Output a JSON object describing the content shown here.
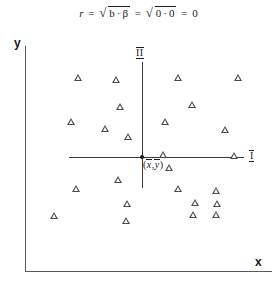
{
  "figure": {
    "formula": {
      "lhs_var": "r",
      "eq1": "=",
      "radicand1_a": "b",
      "radicand1_dot": "·",
      "radicand1_b": "β",
      "eq2": "=",
      "radicand2_a": "0",
      "radicand2_dot": "·",
      "radicand2_b": "0",
      "eq3": "=",
      "result": "0",
      "radical_glyph": "√",
      "full_text": "r = √(b·β) = √(0·0) = 0"
    },
    "axes": {
      "y_label": "y",
      "x_label": "x"
    },
    "quadrants": {
      "upper_label": "II",
      "right_label": "I"
    },
    "centroid": {
      "open_paren": "(",
      "x_bar": "x",
      "comma": ",",
      "y_bar": "y",
      "close_paren": ")",
      "full_text": "(x̄,ȳ)"
    },
    "marker": {
      "icon": "triangle-marker",
      "color": "#4a4a52"
    }
  },
  "chart_data": {
    "type": "scatter",
    "xlabel": "x",
    "ylabel": "y",
    "grid": false,
    "legend": null,
    "annotations": [
      {
        "text": "II",
        "role": "quadrant-divider-label",
        "px": [
          139,
          52
        ]
      },
      {
        "text": "I",
        "role": "quadrant-axis-label",
        "px": [
          251,
          155
        ]
      },
      {
        "text": "(x̄,ȳ)",
        "role": "centroid-label",
        "px": [
          143,
          164
        ]
      }
    ],
    "reference_lines": [
      {
        "orientation": "vertical",
        "label": "mean-x",
        "px_x": 142
      },
      {
        "orientation": "horizontal",
        "label": "mean-y",
        "px_y": 157
      }
    ],
    "origin_marker": {
      "label": "(x̄,ȳ)",
      "px": [
        142,
        157
      ]
    },
    "note": "Point coordinates are given in figure pixel space (origin of data cross at 142,157); y grows downward.",
    "points_px": [
      [
        78,
        78
      ],
      [
        116,
        80
      ],
      [
        178,
        78
      ],
      [
        238,
        78
      ],
      [
        120,
        107
      ],
      [
        192,
        105
      ],
      [
        71,
        122
      ],
      [
        105,
        129
      ],
      [
        128,
        137
      ],
      [
        165,
        122
      ],
      [
        225,
        130
      ],
      [
        163,
        155
      ],
      [
        169,
        168
      ],
      [
        234,
        156
      ],
      [
        118,
        180
      ],
      [
        76,
        189
      ],
      [
        178,
        189
      ],
      [
        127,
        204
      ],
      [
        216,
        191
      ],
      [
        195,
        203
      ],
      [
        217,
        204
      ],
      [
        54,
        216
      ],
      [
        126,
        221
      ],
      [
        193,
        215
      ],
      [
        216,
        215
      ]
    ],
    "series": [
      {
        "name": "observations",
        "marker": "triangle",
        "color": "#4a4a52",
        "n": 25,
        "quadrant_counts": {
          "upper_left": 7,
          "upper_right": 7,
          "lower_left": 5,
          "lower_right": 6
        }
      }
    ],
    "correlation": {
      "r": 0,
      "b": 0,
      "beta": 0
    }
  }
}
